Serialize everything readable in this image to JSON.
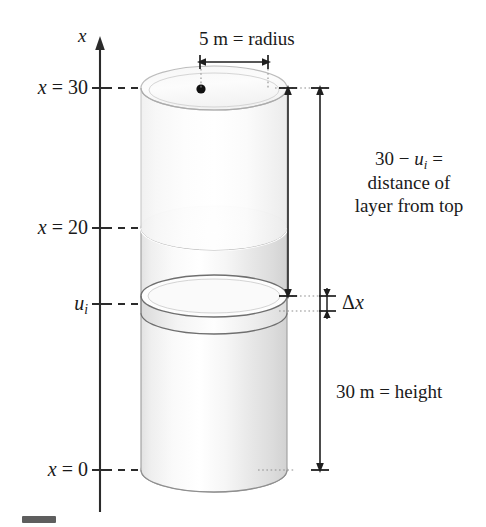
{
  "figure": {
    "kind": "cylindrical-tank-diagram",
    "axis": {
      "name": "x",
      "ticks": [
        {
          "id": "x30",
          "label_html": "x = 30",
          "value": 30
        },
        {
          "id": "x20",
          "label_html": "x = 20",
          "value": 20
        },
        {
          "id": "ui",
          "label_html": "uᵢ",
          "value": null
        },
        {
          "id": "x0",
          "label_html": "x = 0",
          "value": 0
        }
      ]
    },
    "annotations": {
      "radius": "5 m = radius",
      "distance_line1": "30 − uᵢ =",
      "distance_line2": "distance of",
      "distance_line3": "layer from top",
      "slab_thickness": "Δx",
      "height": "30 m = height"
    },
    "colors": {
      "ink": "#1a1a1a",
      "line": "#2b2b2b",
      "cylinder_light": "#fbfbfb",
      "cylinder_mid": "#e6e6e6",
      "cylinder_shadow": "#cfcfcf",
      "dot": "#111111",
      "guide": "#8a8a8a",
      "background": "#ffffff"
    }
  }
}
